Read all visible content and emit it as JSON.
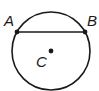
{
  "diagram": {
    "type": "circle-with-chord",
    "circle": {
      "cx": 51,
      "cy": 51,
      "r": 39,
      "stroke": "#1a1a1a"
    },
    "chord": {
      "from": "A",
      "to": "B"
    },
    "points": [
      {
        "name": "A",
        "x": 17,
        "y": 32,
        "label": "A",
        "label_x": 4,
        "label_y": 26
      },
      {
        "name": "B",
        "x": 85,
        "y": 32,
        "label": "B",
        "label_x": 87,
        "label_y": 26
      },
      {
        "name": "C",
        "x": 51,
        "y": 51,
        "label": "C",
        "label_x": 36,
        "label_y": 67
      }
    ]
  }
}
